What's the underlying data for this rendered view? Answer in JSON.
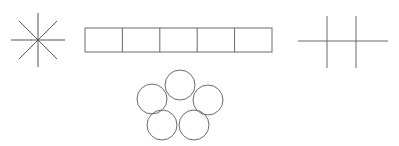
{
  "canvas": {
    "width": 399,
    "height": 146,
    "background_color": "#ffffff",
    "stroke_color": "#5a5a5a",
    "stroke_color_dark": "#4a4a4a",
    "stroke_width": 1
  },
  "figures": [
    {
      "id": "asterisk",
      "name": "eight-spoke-asterisk",
      "type": "starburst",
      "center": {
        "x": 38,
        "y": 40
      },
      "radius": 27,
      "spoke_count": 8,
      "spoke_angles_deg": [
        0,
        45,
        90,
        135,
        180,
        225,
        270,
        315
      ],
      "stroke_color": "#555555",
      "stroke_width": 1
    },
    {
      "id": "bar",
      "name": "five-cell-rectangle-bar",
      "type": "segmented-rectangle",
      "x": 85,
      "y": 28,
      "width": 187,
      "height": 24,
      "cell_count": 5,
      "cell_width": 37.4,
      "stroke_color": "#6a6a6a",
      "stroke_width": 1,
      "fill": "#ffffff"
    },
    {
      "id": "circle-ring",
      "name": "five-circle-ring",
      "type": "circle-cluster",
      "circle_count": 5,
      "radius": 15,
      "stroke_color": "#6a6a6a",
      "stroke_width": 1,
      "fill": "none",
      "circles": [
        {
          "name": "circle-top",
          "cx": 180,
          "cy": 85
        },
        {
          "name": "circle-right",
          "cx": 208,
          "cy": 100
        },
        {
          "name": "circle-bottom-right",
          "cx": 194,
          "cy": 125
        },
        {
          "name": "circle-bottom-left",
          "cx": 162,
          "cy": 125
        },
        {
          "name": "circle-left",
          "cx": 152,
          "cy": 99
        }
      ]
    },
    {
      "id": "grid-cross",
      "name": "grid-cross-lines",
      "type": "line-grid",
      "stroke_color": "#6a6a6a",
      "stroke_width": 1,
      "vertical_lines": [
        {
          "name": "vertical-line-left",
          "x": 327,
          "y1": 16,
          "y2": 68
        },
        {
          "name": "vertical-line-right",
          "x": 356,
          "y1": 16,
          "y2": 68
        }
      ],
      "horizontal_lines": [
        {
          "name": "horizontal-line",
          "y": 41,
          "x1": 298,
          "x2": 388
        }
      ]
    }
  ]
}
